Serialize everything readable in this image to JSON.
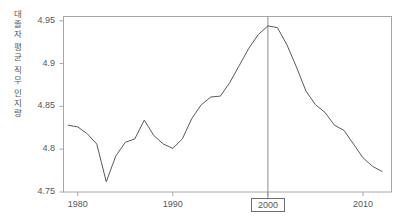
{
  "chart_data": {
    "type": "line",
    "title": "",
    "subtitle": "",
    "xlabel": "",
    "ylabel": "대졸자 평균 직무 인지량",
    "ylabel_chars": [
      "대",
      "졸",
      "자",
      "평",
      "균",
      "직",
      "무",
      "인",
      "지",
      "량"
    ],
    "ylabel_words": [
      "대졸자",
      "평균",
      "직무",
      "인지량"
    ],
    "xlim": [
      1978.5,
      2013.0
    ],
    "ylim": [
      4.75,
      4.955
    ],
    "grid": false,
    "legend": null,
    "legend_position": "none",
    "line_color": "#5a5a5c",
    "axis_color": "#9a9a9c",
    "text_color": "#58585a",
    "highlight_color": "#6d6d70",
    "yticks": [
      "4.95",
      "4.9",
      "4.85",
      "4.8",
      "4.75"
    ],
    "ytick_values": [
      4.95,
      4.9,
      4.85,
      4.8,
      4.75
    ],
    "xticks": [
      "1980",
      "1990",
      "2000",
      "2010"
    ],
    "xtick_values": [
      1980,
      1990,
      2000,
      2010
    ],
    "highlighted_xtick": "2000",
    "annotations": [
      {
        "name": "year-2000-marker",
        "x": 2000,
        "label": "2000",
        "type": "vertical-line-with-boxed-label"
      }
    ],
    "x": [
      1979,
      1980,
      1981,
      1982,
      1983,
      1984,
      1985,
      1986,
      1987,
      1988,
      1989,
      1990,
      1991,
      1992,
      1993,
      1994,
      1995,
      1996,
      1997,
      1998,
      1999,
      2000,
      2001,
      2002,
      2003,
      2004,
      2005,
      2006,
      2007,
      2008,
      2009,
      2010,
      2011,
      2012
    ],
    "values": [
      4.828,
      4.826,
      4.818,
      4.806,
      4.762,
      4.792,
      4.808,
      4.812,
      4.834,
      4.816,
      4.806,
      4.801,
      4.812,
      4.836,
      4.852,
      4.861,
      4.862,
      4.878,
      4.898,
      4.918,
      4.934,
      4.944,
      4.942,
      4.922,
      4.896,
      4.868,
      4.852,
      4.843,
      4.828,
      4.822,
      4.806,
      4.79,
      4.78,
      4.774
    ],
    "series": [
      {
        "name": "대졸자 평균 직무 인지량",
        "values": [
          4.828,
          4.826,
          4.818,
          4.806,
          4.762,
          4.792,
          4.808,
          4.812,
          4.834,
          4.816,
          4.806,
          4.801,
          4.812,
          4.836,
          4.852,
          4.861,
          4.862,
          4.878,
          4.898,
          4.918,
          4.934,
          4.944,
          4.942,
          4.922,
          4.896,
          4.868,
          4.852,
          4.843,
          4.828,
          4.822,
          4.806,
          4.79,
          4.78,
          4.774
        ]
      }
    ]
  }
}
